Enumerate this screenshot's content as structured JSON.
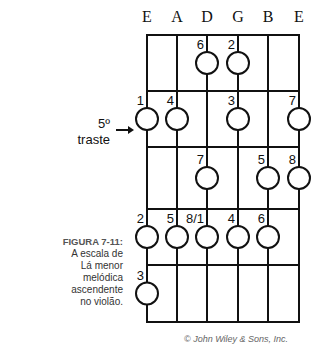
{
  "figure": {
    "id_label": "FIGURA 7-11:",
    "caption_lines": [
      "A escala de",
      "Lá menor",
      "melódica",
      "ascendente",
      "no violão."
    ],
    "credit": "© John Wiley & Sons, Inc."
  },
  "fret_marker": {
    "line1": "5º",
    "line2": "traste",
    "arrow": "right-arrow"
  },
  "fretboard": {
    "strings": [
      "E",
      "A",
      "D",
      "G",
      "B",
      "E"
    ],
    "string_x": [
      147,
      177,
      207,
      238,
      268,
      299
    ],
    "fret_y": [
      35,
      91,
      147,
      209,
      265,
      322
    ],
    "notes": [
      {
        "fret_row": 0,
        "string": 2,
        "degree": "6"
      },
      {
        "fret_row": 0,
        "string": 3,
        "degree": "2"
      },
      {
        "fret_row": 1,
        "string": 0,
        "degree": "1"
      },
      {
        "fret_row": 1,
        "string": 1,
        "degree": "4"
      },
      {
        "fret_row": 1,
        "string": 3,
        "degree": "3"
      },
      {
        "fret_row": 1,
        "string": 5,
        "degree": "7"
      },
      {
        "fret_row": 2,
        "string": 2,
        "degree": "7"
      },
      {
        "fret_row": 2,
        "string": 4,
        "degree": "5"
      },
      {
        "fret_row": 2,
        "string": 5,
        "degree": "8"
      },
      {
        "fret_row": 3,
        "string": 0,
        "degree": "2"
      },
      {
        "fret_row": 3,
        "string": 1,
        "degree": "5"
      },
      {
        "fret_row": 3,
        "string": 2,
        "degree": "8/1"
      },
      {
        "fret_row": 3,
        "string": 3,
        "degree": "4"
      },
      {
        "fret_row": 3,
        "string": 4,
        "degree": "6"
      },
      {
        "fret_row": 4,
        "string": 0,
        "degree": "3"
      }
    ]
  }
}
